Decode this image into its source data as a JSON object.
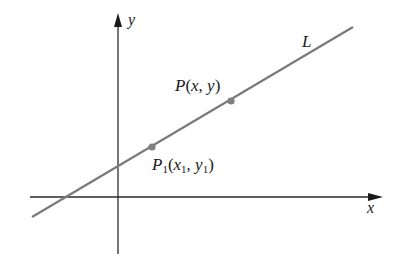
{
  "diagram": {
    "type": "coordinate-plane-line",
    "axes": {
      "x_label": "x",
      "y_label": "y",
      "color": "#2a2a2a"
    },
    "line": {
      "label": "L",
      "color": "#7a7a7a"
    },
    "points": [
      {
        "id": "P1",
        "name": "P",
        "subscript": "1",
        "coord_x": "x",
        "coord_x_sub": "1",
        "coord_y": "y",
        "coord_y_sub": "1",
        "color": "#808080"
      },
      {
        "id": "P",
        "name": "P",
        "coord_x": "x",
        "coord_y": "y",
        "color": "#808080"
      }
    ],
    "punct": {
      "open": "(",
      "comma": ",",
      "close": ")"
    }
  }
}
